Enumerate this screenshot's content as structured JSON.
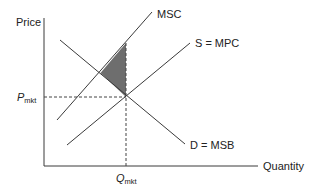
{
  "diagram": {
    "type": "supply-demand-externality",
    "axes": {
      "y_label": "Price",
      "x_label": "Quantity"
    },
    "curves": [
      {
        "id": "msc",
        "label": "MSC"
      },
      {
        "id": "supply",
        "label": "S = MPC"
      },
      {
        "id": "demand",
        "label": "D = MSB"
      }
    ],
    "markers": {
      "price": {
        "main": "P",
        "sub": "mkt"
      },
      "quantity": {
        "main": "Q",
        "sub": "mkt"
      }
    },
    "shaded_region": "deadweight-loss",
    "colors": {
      "line": "#3a3a3a",
      "shade": "#6e6e6e",
      "dash": "#444444"
    }
  }
}
